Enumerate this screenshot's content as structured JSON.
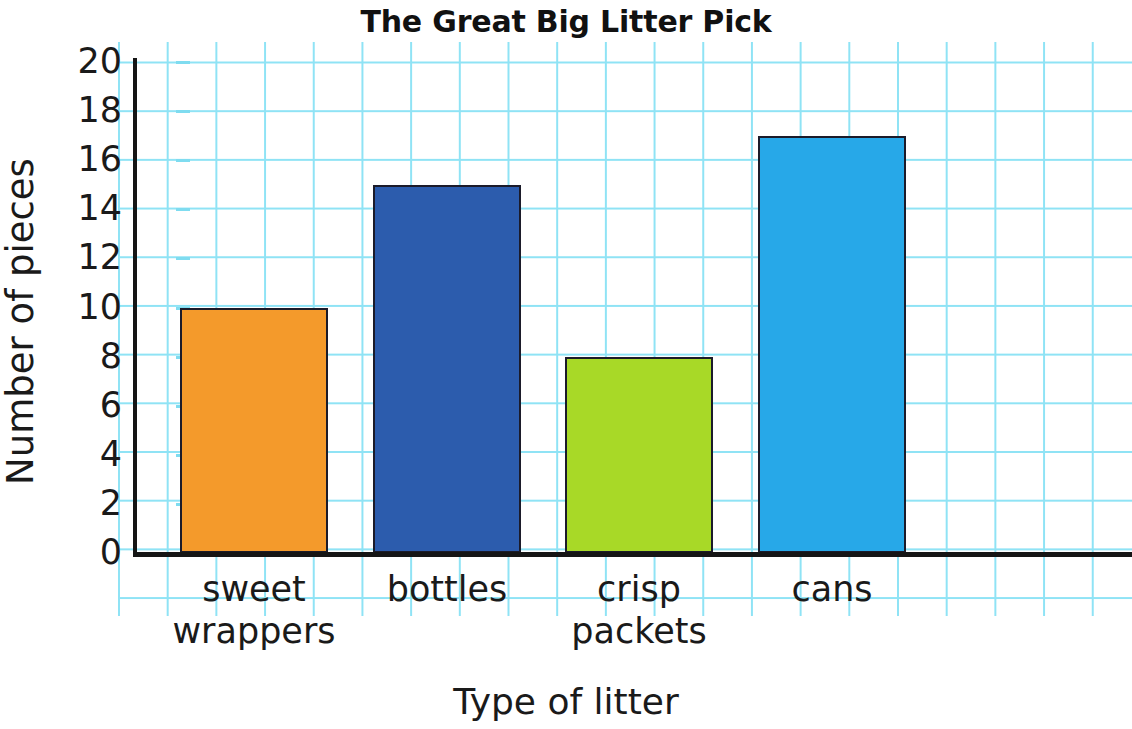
{
  "chart_data": {
    "type": "bar",
    "title": "The Great Big Litter Pick",
    "xlabel": "Type of litter",
    "ylabel": "Number of pieces",
    "categories": [
      "sweet wrappers",
      "bottles",
      "crisp packets",
      "cans"
    ],
    "values": [
      10,
      15,
      8,
      17
    ],
    "ylim": [
      0,
      20
    ],
    "ytick_labels": [
      "0",
      "2",
      "4",
      "6",
      "8",
      "10",
      "12",
      "14",
      "16",
      "18",
      "20"
    ],
    "ytick_values": [
      0,
      2,
      4,
      6,
      8,
      10,
      12,
      14,
      16,
      18,
      20
    ],
    "grid": "squared graph paper, cyan lines, one cell = 2 units",
    "legend": "none",
    "bar_colors": [
      "#F49A2B",
      "#2C5CAD",
      "#A8D927",
      "#27A8E8"
    ],
    "bar_outline_color": "#1B1B2A",
    "bars": [
      {
        "category": "sweet wrappers",
        "label_line1": "sweet",
        "label_line2": "wrappers",
        "value": 10,
        "color": "#F49A2B"
      },
      {
        "category": "bottles",
        "label_line1": "bottles",
        "label_line2": "",
        "value": 15,
        "color": "#2C5CAD"
      },
      {
        "category": "crisp packets",
        "label_line1": "crisp",
        "label_line2": "packets",
        "value": 8,
        "color": "#A8D927"
      },
      {
        "category": "cans",
        "label_line1": "cans",
        "label_line2": "",
        "value": 17,
        "color": "#27A8E8"
      }
    ]
  },
  "colors": {
    "grid_line": "#8FE3F5",
    "axis_line": "#151515",
    "text": "#1A1A1A",
    "background": "#FFFFFF"
  }
}
